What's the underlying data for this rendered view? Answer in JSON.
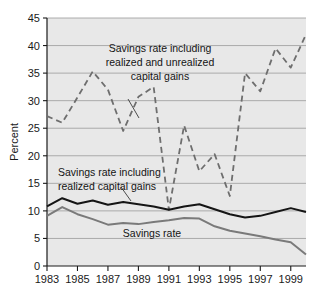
{
  "chart_data": {
    "type": "line",
    "title": "",
    "xlabel": "",
    "ylabel": "Percent",
    "xlim": [
      1983,
      2000
    ],
    "ylim": [
      0,
      45
    ],
    "grid": true,
    "legend_position": "inline-annotations",
    "plot_background": "#e8e8e8",
    "x": [
      1983,
      1984,
      1985,
      1986,
      1987,
      1988,
      1989,
      1990,
      1991,
      1992,
      1993,
      1994,
      1995,
      1996,
      1997,
      1998,
      1999,
      2000
    ],
    "xticks": [
      1983,
      1985,
      1987,
      1989,
      1991,
      1993,
      1995,
      1997,
      1999
    ],
    "xtick_labels": [
      "1983",
      "1985",
      "1987",
      "1989",
      "1991",
      "1993",
      "1995",
      "1997",
      "1999"
    ],
    "yticks": [
      0,
      5,
      10,
      15,
      20,
      25,
      30,
      35,
      40,
      45
    ],
    "ytick_labels": [
      "0",
      "5",
      "10",
      "15",
      "20",
      "25",
      "30",
      "35",
      "40",
      "45"
    ],
    "series": [
      {
        "name": "Savings rate including realized and unrealized capital gains",
        "style": "dashed",
        "color": "#6e6e6e",
        "values": [
          27.2,
          26.0,
          30.6,
          35.3,
          32.0,
          24.5,
          30.7,
          32.5,
          10.2,
          25.5,
          17.2,
          20.3,
          12.7,
          35.0,
          31.7,
          39.5,
          36.0,
          42.0
        ]
      },
      {
        "name": "Savings rate including realized capital gains",
        "style": "solid",
        "color": "#151515",
        "values": [
          10.8,
          12.3,
          11.3,
          11.9,
          11.1,
          11.6,
          11.2,
          10.8,
          10.2,
          10.8,
          11.2,
          10.3,
          9.4,
          8.8,
          9.1,
          9.8,
          10.5,
          9.8
        ]
      },
      {
        "name": "Savings rate",
        "style": "solid",
        "color": "#7a7a7a",
        "values": [
          9.1,
          10.7,
          9.4,
          8.5,
          7.5,
          7.8,
          7.6,
          8.0,
          8.3,
          8.7,
          8.6,
          7.2,
          6.4,
          5.9,
          5.4,
          4.8,
          4.3,
          2.1
        ]
      }
    ],
    "annotations": [
      {
        "id": "annotation-unrealized",
        "lines": [
          "Savings rate including",
          "realized and unrealized",
          "capital gains"
        ]
      },
      {
        "id": "annotation-realized",
        "lines": [
          "Savings rate including",
          "realized capital gains"
        ]
      },
      {
        "id": "annotation-savings-rate",
        "lines": [
          "Savings rate"
        ]
      }
    ]
  }
}
